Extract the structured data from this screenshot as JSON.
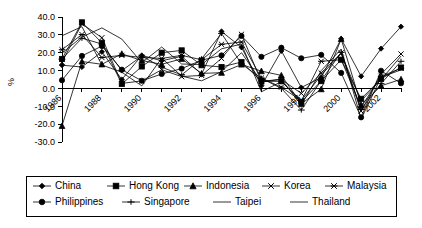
{
  "chart_data": {
    "type": "line",
    "title": "",
    "xlabel": "",
    "ylabel": "%",
    "ylim": [
      -30.0,
      40.0
    ],
    "yticks": [
      "40.0",
      "30.0",
      "20.0",
      "10.0",
      "0.0",
      "-10.0",
      "-20.0",
      "-30.0"
    ],
    "ytick_values": [
      40.0,
      30.0,
      20.0,
      10.0,
      0.0,
      -10.0,
      -20.0,
      -30.0
    ],
    "grid": false,
    "legend_position": "bottom",
    "x": [
      1986,
      1987,
      1988,
      1989,
      1990,
      1991,
      1992,
      1993,
      1994,
      1995,
      1996,
      1997,
      1998,
      1999,
      2000,
      2001,
      2002,
      2003
    ],
    "xticks_labeled": [
      "1986",
      "1988",
      "1990",
      "1992",
      "1994",
      "1996",
      "1998",
      "2000",
      "2002"
    ],
    "xlim": [
      1986,
      2003
    ],
    "series": [
      {
        "name": "China",
        "marker": "diamond",
        "values": [
          13.0,
          12.0,
          20.5,
          5.0,
          18.5,
          15.5,
          18.0,
          8.0,
          31.9,
          23.0,
          1.5,
          21.0,
          0.5,
          6.1,
          27.8,
          6.8,
          22.3,
          34.6
        ]
      },
      {
        "name": "Hong Kong",
        "marker": "square",
        "values": [
          16.5,
          37.0,
          25.5,
          2.5,
          12.3,
          20.0,
          21.3,
          13.0,
          12.0,
          14.8,
          4.0,
          4.0,
          -7.5,
          4.1,
          16.1,
          -5.8,
          5.4,
          11.7
        ]
      },
      {
        "name": "Indonesia",
        "marker": "triangle",
        "values": [
          -21.0,
          15.1,
          13.5,
          19.4,
          15.6,
          13.5,
          16.6,
          8.4,
          8.8,
          13.4,
          9.7,
          7.3,
          -8.6,
          -0.4,
          27.7,
          -9.3,
          1.5,
          5.1
        ]
      },
      {
        "name": "Korea",
        "marker": "x",
        "values": [
          14.6,
          36.2,
          28.4,
          2.8,
          4.2,
          10.5,
          6.6,
          7.3,
          16.8,
          30.3,
          3.7,
          5.0,
          -2.8,
          8.6,
          19.9,
          -12.7,
          8.0,
          19.3
        ]
      },
      {
        "name": "Malaysia",
        "marker": "star",
        "values": [
          21.7,
          30.2,
          17.3,
          18.5,
          17.4,
          16.8,
          18.5,
          16.1,
          24.7,
          26.0,
          5.8,
          0.7,
          -6.9,
          15.2,
          16.1,
          -10.4,
          6.8,
          11.3
        ]
      },
      {
        "name": "Philippines",
        "marker": "circle",
        "values": [
          4.6,
          18.2,
          23.7,
          10.5,
          4.3,
          8.1,
          11.1,
          15.8,
          18.5,
          29.4,
          17.7,
          22.8,
          16.9,
          18.8,
          8.7,
          -16.2,
          9.9,
          2.9
        ]
      },
      {
        "name": "Singapore",
        "marker": "plus",
        "values": [
          16.5,
          28.1,
          24.9,
          10.0,
          18.1,
          11.9,
          7.6,
          16.6,
          30.8,
          13.7,
          5.7,
          0.0,
          -12.1,
          4.4,
          20.2,
          -11.8,
          2.7,
          15.2
        ]
      },
      {
        "name": "Taipei",
        "marker": "none",
        "values": [
          29.5,
          34.6,
          13.1,
          9.1,
          1.4,
          17.0,
          6.9,
          4.3,
          9.4,
          20.0,
          3.8,
          5.3,
          -9.4,
          10.0,
          22.0,
          -17.2,
          6.3,
          10.4
        ]
      },
      {
        "name": "Thailand",
        "marker": "none",
        "values": [
          19.8,
          28.8,
          33.9,
          27.6,
          14.4,
          23.2,
          13.7,
          13.4,
          22.2,
          24.8,
          -1.9,
          3.8,
          -6.8,
          7.4,
          19.5,
          -7.0,
          4.9,
          18.1
        ]
      }
    ]
  },
  "legend": {
    "rows": [
      [
        {
          "label": "China",
          "marker": "diamond"
        },
        {
          "label": "Hong Kong",
          "marker": "square"
        },
        {
          "label": "Indonesia",
          "marker": "triangle"
        },
        {
          "label": "Korea",
          "marker": "x"
        },
        {
          "label": "Malaysia",
          "marker": "star"
        }
      ],
      [
        {
          "label": "Philippines",
          "marker": "circle"
        },
        {
          "label": "Singapore",
          "marker": "plus"
        },
        {
          "label": "Taipei",
          "marker": "none"
        },
        {
          "label": "Thailand",
          "marker": "none"
        }
      ]
    ]
  },
  "axis": {
    "y_title": "%"
  }
}
